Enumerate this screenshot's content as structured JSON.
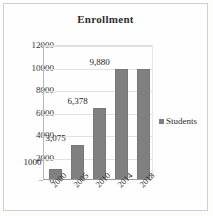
{
  "chart_data": {
    "type": "bar",
    "title": "Enrollment",
    "xlabel": "",
    "ylabel": "",
    "categories": [
      "2000",
      "2005",
      "2010",
      "2014",
      "2018"
    ],
    "values": [
      1000,
      3075,
      6378,
      9880,
      9880
    ],
    "data_labels": [
      "1000",
      "3,075",
      "6,378",
      "9,880",
      ""
    ],
    "ylim": [
      0,
      12000
    ],
    "ytick_values": [
      0,
      2000,
      4000,
      6000,
      8000,
      10000,
      12000
    ],
    "ytick_labels": [
      "0",
      "2000",
      "4000",
      "6000",
      "8000",
      "10000",
      "12000"
    ],
    "grid": true,
    "legend": [
      {
        "name": "Students",
        "color": "#808080"
      }
    ],
    "legend_position": "right",
    "bar_color": "#808080",
    "xtick_rotation": -45
  }
}
